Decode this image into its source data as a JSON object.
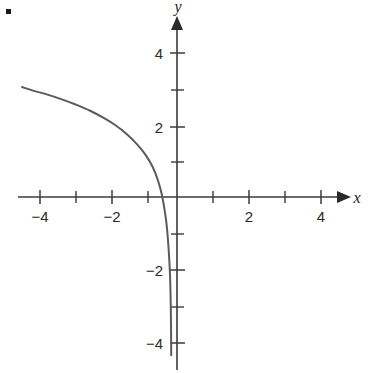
{
  "figure": {
    "bullet_marker": "▪",
    "background_color": "#ffffff",
    "axis_color": "#3a3a3a",
    "curve_color": "#5a5a5a"
  },
  "axis_labels": {
    "x_name": "x",
    "y_name": "y"
  },
  "chart_data": {
    "type": "line",
    "title": "",
    "subtitle": "",
    "xlabel": "x",
    "ylabel": "y",
    "xlim": [
      -4.9,
      5.3
    ],
    "ylim": [
      -4.7,
      4.8
    ],
    "grid": false,
    "legend": null,
    "x_ticks_major": [
      -4,
      -2,
      2,
      4
    ],
    "x_ticks_minor": [
      -3,
      -1,
      1,
      3
    ],
    "x_tick_labels": [
      "−4",
      "−2",
      "2",
      "4"
    ],
    "y_ticks_major": [
      4,
      2,
      -2,
      -4
    ],
    "y_ticks_minor": [
      3,
      1,
      -1,
      -3
    ],
    "y_tick_labels": [
      "4",
      "2",
      "−2",
      "−4"
    ],
    "series": [
      {
        "name": "curve",
        "description": "decreasing logarithmic curve with vertical asymptote near x = -0.15",
        "x": [
          -4.28,
          -4.0,
          -3.6,
          -3.2,
          -2.8,
          -2.4,
          -2.0,
          -1.7,
          -1.4,
          -1.2,
          -1.0,
          -0.85,
          -0.7,
          -0.6,
          -0.5,
          -0.42,
          -0.36,
          -0.3,
          -0.26,
          -0.23,
          -0.2,
          -0.185,
          -0.175,
          -0.168,
          -0.163,
          -0.16
        ],
        "y": [
          3.02,
          2.93,
          2.82,
          2.69,
          2.54,
          2.37,
          2.16,
          1.97,
          1.74,
          1.55,
          1.33,
          1.13,
          0.88,
          0.66,
          0.37,
          0.07,
          -0.25,
          -0.65,
          -1.05,
          -1.45,
          -1.98,
          -2.4,
          -2.85,
          -3.3,
          -3.8,
          -4.35
        ]
      }
    ]
  }
}
